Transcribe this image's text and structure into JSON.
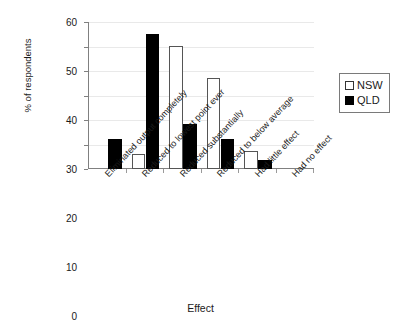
{
  "chart_data": {
    "type": "bar",
    "title": "",
    "xlabel": "Effect",
    "ylabel": "% of respondents",
    "categories": [
      "Eliminated output completely",
      "Reduced to lowest point ever",
      "Reduced substantially",
      "Reduced to below average",
      "Had little effect",
      "Had no effect"
    ],
    "series": [
      {
        "name": "NSW",
        "color": "#ffffff",
        "values": [
          0,
          6.0,
          50.3,
          37.3,
          7.3,
          0
        ]
      },
      {
        "name": "QLD",
        "color": "#000000",
        "values": [
          12.1,
          55.2,
          18.5,
          12.3,
          3.5,
          0
        ]
      }
    ],
    "ylim": [
      0,
      60
    ],
    "yticks": [
      0,
      10,
      20,
      30,
      40,
      50,
      60
    ],
    "ytick_labels": [
      "0",
      "10",
      "20",
      "30",
      "40",
      "50",
      "60"
    ],
    "grid": true,
    "legend_position": "right",
    "legend_entries": [
      "NSW",
      "QLD"
    ]
  }
}
